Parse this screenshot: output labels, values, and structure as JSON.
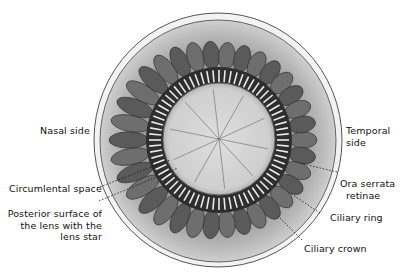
{
  "figure": {
    "labels": {
      "nasal_side": "Nasal side",
      "temporal_side_1": "Temporal",
      "temporal_side_2": "side",
      "circumlental_space": "Circumlental space",
      "posterior_surface_1": "Posterior surface of",
      "posterior_surface_2": "the lens with the",
      "posterior_surface_3": "lens star",
      "ora_serrata_1": "Ora serrata",
      "ora_serrata_2": "retinae",
      "ciliary_ring": "Ciliary ring",
      "ciliary_crown": "Ciliary crown"
    },
    "colors": {
      "background": "#ffffff",
      "outer_rim": "#e6e6e6",
      "ciliary_ring_fill": "#bdbdbd",
      "processes_dark": "#3a3a3a",
      "lens_fill": "#d6d6d6",
      "ink": "#111111"
    }
  }
}
